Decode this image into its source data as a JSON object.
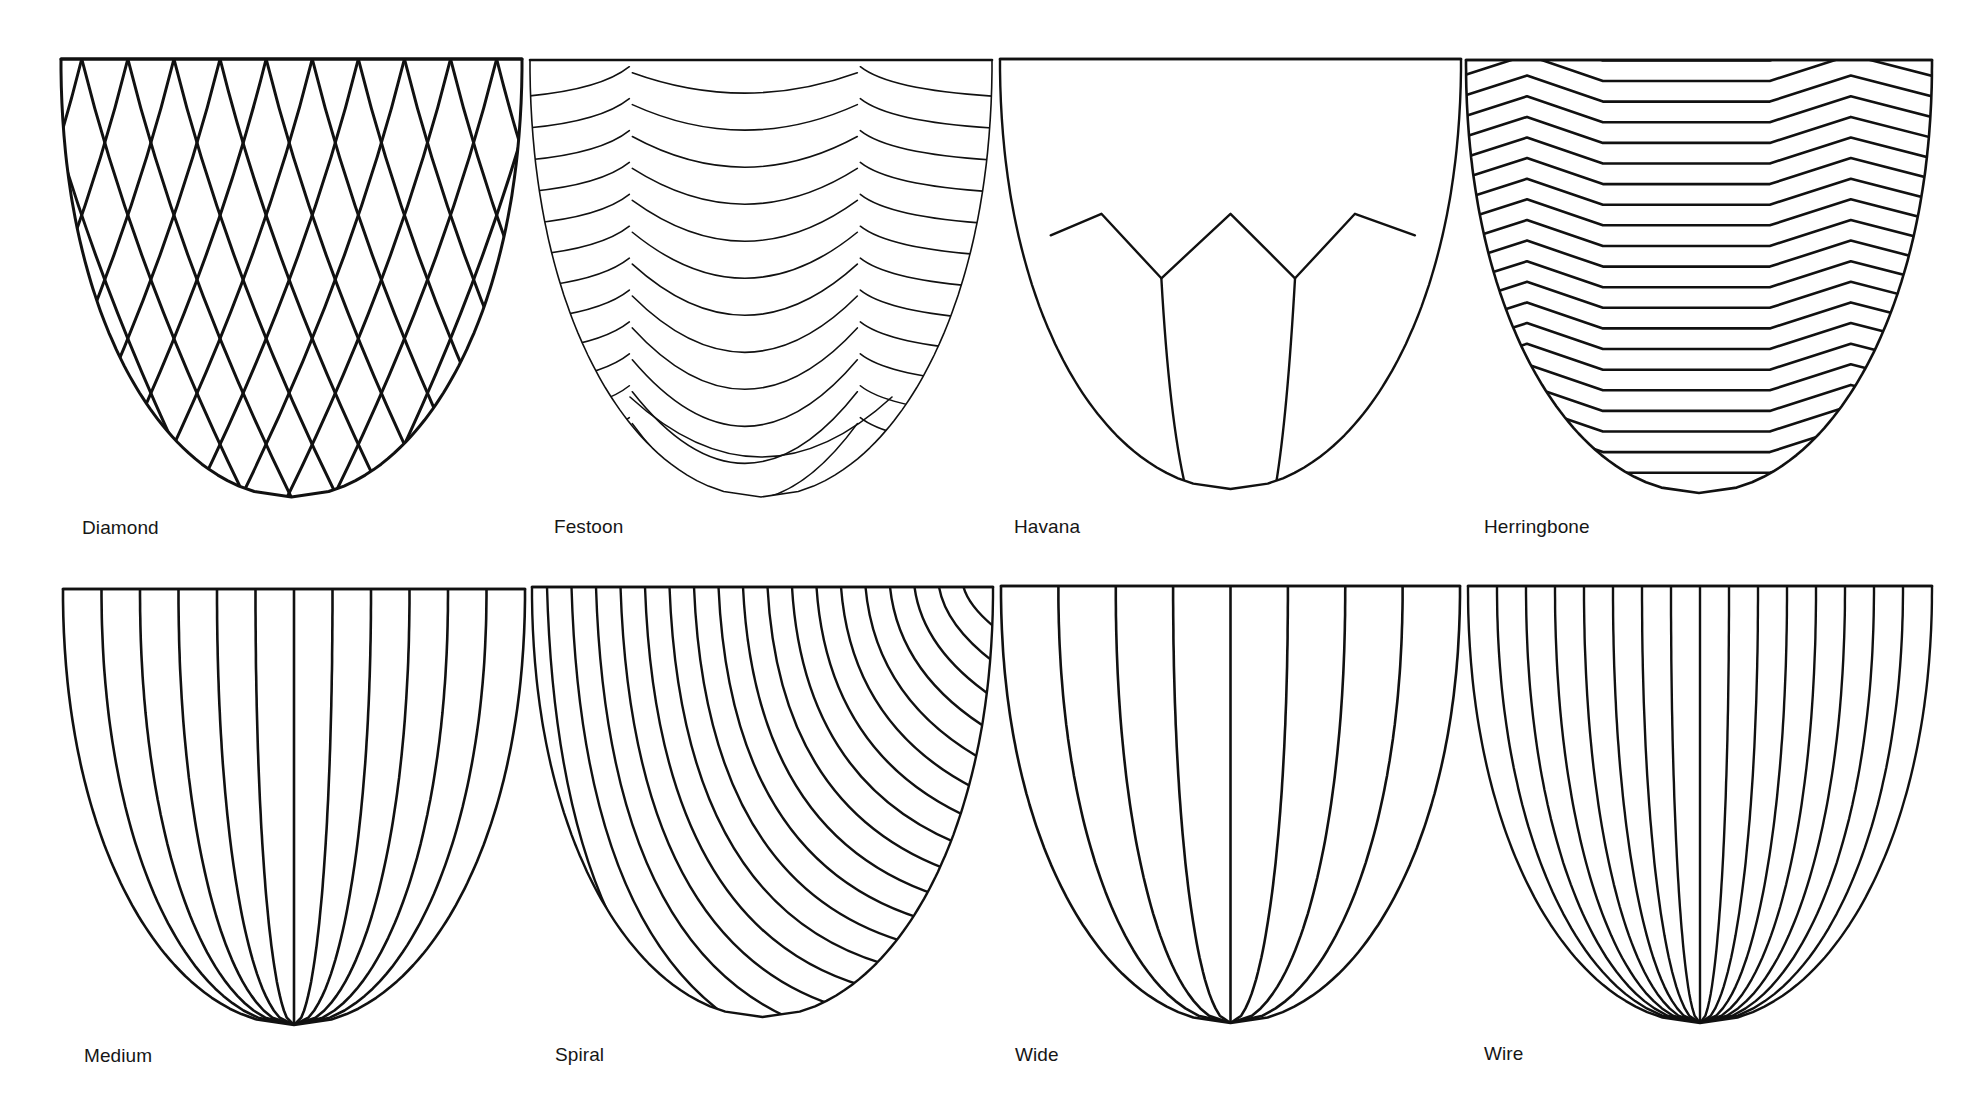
{
  "figure": {
    "title": "",
    "stroke_color": "#111111",
    "background": "#ffffff"
  },
  "panels": [
    {
      "name": "Diamond",
      "pattern": "diamond",
      "label_pos": [
        82,
        517
      ],
      "bowl": {
        "x1": 61,
        "x2": 522,
        "top": 59,
        "bottom": 497
      },
      "stroke_width": 3,
      "arc_count": 10
    },
    {
      "name": "Festoon",
      "pattern": "festoon",
      "label_pos": [
        554,
        516
      ],
      "bowl": {
        "x1": 530,
        "x2": 992,
        "top": 60,
        "bottom": 497
      },
      "stroke_width": 1.6,
      "row_count": 12,
      "scallops": 3
    },
    {
      "name": "Havana",
      "pattern": "havana",
      "label_pos": [
        1014,
        516
      ],
      "bowl": {
        "x1": 1000,
        "x2": 1461,
        "top": 59,
        "bottom": 489
      },
      "stroke_width": 2.4
    },
    {
      "name": "Herringbone",
      "pattern": "herringbone",
      "label_pos": [
        1484,
        516
      ],
      "bowl": {
        "x1": 1466,
        "x2": 1932,
        "top": 60,
        "bottom": 493
      },
      "stroke_width": 2.6,
      "row_count": 21,
      "zigzag_peaks": 3
    },
    {
      "name": "Medium",
      "pattern": "radial",
      "label_pos": [
        84,
        1045
      ],
      "bowl": {
        "x1": 63,
        "x2": 525,
        "top": 589,
        "bottom": 1025
      },
      "stroke_width": 2.6,
      "rib_count": 11
    },
    {
      "name": "Spiral",
      "pattern": "spiral",
      "label_pos": [
        555,
        1044
      ],
      "bowl": {
        "x1": 532,
        "x2": 993,
        "top": 587,
        "bottom": 1017
      },
      "stroke_width": 2.4,
      "line_count": 18
    },
    {
      "name": "Wide",
      "pattern": "radial",
      "label_pos": [
        1015,
        1044
      ],
      "bowl": {
        "x1": 1001,
        "x2": 1460,
        "top": 586,
        "bottom": 1023
      },
      "stroke_width": 2.6,
      "rib_count": 7
    },
    {
      "name": "Wire",
      "pattern": "radial",
      "label_pos": [
        1484,
        1043
      ],
      "bowl": {
        "x1": 1468,
        "x2": 1932,
        "top": 586,
        "bottom": 1023
      },
      "stroke_width": 2.4,
      "rib_count": 15
    }
  ]
}
